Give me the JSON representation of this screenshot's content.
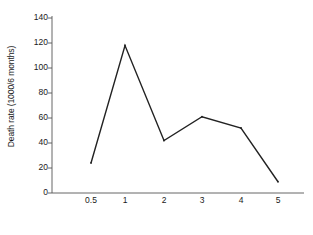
{
  "chart_data": {
    "type": "line",
    "title": "",
    "xlabel": "Age (years)",
    "ylabel": "Death rate (1000/6 months)",
    "categories": [
      "0.5",
      "1",
      "2",
      "3",
      "4",
      "5"
    ],
    "values": [
      24,
      118,
      42,
      61,
      52,
      9
    ],
    "series": [
      {
        "name": "Death rate",
        "values": [
          24,
          118,
          42,
          61,
          52,
          9
        ]
      }
    ],
    "ylim": [
      0,
      140
    ],
    "yticks": [
      0,
      20,
      40,
      60,
      80,
      100,
      120,
      140
    ],
    "ytick_labels": [
      "0",
      "20",
      "40",
      "60",
      "80",
      "100",
      "120",
      "140"
    ],
    "xtick_labels": [
      "0.5",
      "1",
      "2",
      "3",
      "4",
      "5"
    ],
    "grid": false,
    "legend": false,
    "line_color": "#222222",
    "marker": "none",
    "background_color": "#ffffff"
  }
}
